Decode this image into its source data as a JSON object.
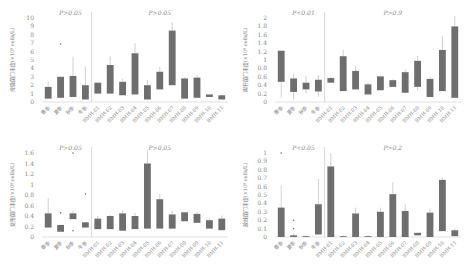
{
  "colors": {
    "bar": "#6e6e6e",
    "whisker": "#bdbdbd",
    "axis": "#cccccc",
    "divider": "#cfcfcf",
    "text": "#888888"
  },
  "chart_data": [
    {
      "type": "bar",
      "title": "",
      "ylabel": "疣微菌门丰度(×10⁸ cells/L)",
      "ylim": [
        0,
        10
      ],
      "yticks": [
        0,
        1,
        2,
        3,
        4,
        5,
        6,
        7,
        8,
        9,
        10
      ],
      "categories": [
        "春季",
        "夏季",
        "秋季",
        "冬季",
        "BMH-01",
        "BMH-02",
        "BMH-03",
        "BMH-04",
        "BMH-05",
        "BMH-06",
        "BMH-07",
        "BMH-08",
        "BMH-09",
        "BMH-10",
        "BMH-11"
      ],
      "series": [
        {
          "name": "box_low",
          "values": [
            0.4,
            0.5,
            0.6,
            0.3,
            1.0,
            1.0,
            0.8,
            0.9,
            0.3,
            1.5,
            2.0,
            0.4,
            0.5,
            0.6,
            0.3
          ]
        },
        {
          "name": "box_high",
          "values": [
            1.8,
            3.0,
            3.1,
            2.0,
            2.3,
            4.4,
            2.4,
            5.8,
            2.0,
            3.6,
            8.5,
            2.8,
            2.9,
            0.9,
            0.8
          ]
        },
        {
          "name": "whisker_high",
          "values": [
            2.4,
            3.0,
            5.4,
            4.2,
            2.3,
            5.4,
            2.8,
            7.0,
            2.6,
            4.2,
            9.5,
            3.0,
            3.2,
            0.9,
            0.9
          ]
        }
      ],
      "outliers": [
        {
          "category": "夏季",
          "value": 6.9
        }
      ],
      "annotations": [
        {
          "text": "P>0.05",
          "group": "season"
        },
        {
          "text": "P>0.05",
          "group": "site"
        }
      ],
      "divider_after": 3,
      "grid": false
    },
    {
      "type": "bar",
      "title": "",
      "ylabel": "拟杆菌门丰度(×10⁸ cells/L)",
      "ylim": [
        0,
        2
      ],
      "yticks": [
        0,
        0.2,
        0.4,
        0.6,
        0.8,
        1,
        1.2,
        1.4,
        1.6,
        1.8,
        2
      ],
      "categories": [
        "春季",
        "夏季",
        "秋季",
        "冬季",
        "BMH-01",
        "BMH-02",
        "BMH-03",
        "BMH-04",
        "BMH-05",
        "BMH-06",
        "BMH-07",
        "BMH-08",
        "BMH-09",
        "BMH-10",
        "BMH-11"
      ],
      "series": [
        {
          "name": "box_low",
          "values": [
            0.48,
            0.24,
            0.3,
            0.25,
            0.46,
            0.26,
            0.3,
            0.18,
            0.28,
            0.36,
            0.22,
            0.36,
            0.12,
            0.26,
            0.1
          ]
        },
        {
          "name": "box_high",
          "values": [
            1.22,
            0.56,
            0.46,
            0.53,
            0.57,
            1.09,
            0.74,
            0.42,
            0.61,
            0.52,
            0.71,
            0.98,
            0.55,
            1.24,
            1.8
          ]
        },
        {
          "name": "whisker_high",
          "values": [
            1.22,
            0.68,
            0.62,
            0.64,
            0.6,
            1.24,
            0.86,
            0.46,
            0.63,
            0.54,
            0.78,
            1.1,
            0.58,
            1.56,
            2.05
          ]
        },
        {
          "name": "whisker_low",
          "values": [
            0.1,
            0.06,
            0.2,
            0.12,
            0.46,
            0.26,
            0.3,
            0.18,
            0.28,
            0.36,
            0.22,
            0.28,
            0.12,
            0.26,
            0.1
          ]
        }
      ],
      "annotations": [
        {
          "text": "P<0.01",
          "group": "season"
        },
        {
          "text": "P>0.9",
          "group": "site"
        }
      ],
      "divider_after": 3,
      "grid": false
    },
    {
      "type": "bar",
      "title": "",
      "ylabel": "变形菌门丰度(×10⁸ cells/L)",
      "ylim": [
        0,
        1.6
      ],
      "yticks": [
        0,
        0.2,
        0.4,
        0.6,
        0.8,
        1,
        1.2,
        1.4,
        1.6
      ],
      "categories": [
        "春季",
        "夏季",
        "秋季",
        "冬季",
        "BMH-01",
        "BMH-02",
        "BMH-03",
        "BMH-04",
        "BMH-05",
        "BMH-06",
        "BMH-07",
        "BMH-08",
        "BMH-09",
        "BMH-10",
        "BMH-11"
      ],
      "series": [
        {
          "name": "box_low",
          "values": [
            0.18,
            0.1,
            0.34,
            0.18,
            0.15,
            0.15,
            0.12,
            0.15,
            0.16,
            0.16,
            0.16,
            0.3,
            0.27,
            0.16,
            0.13
          ]
        },
        {
          "name": "box_high",
          "values": [
            0.45,
            0.23,
            0.45,
            0.28,
            0.35,
            0.4,
            0.45,
            0.4,
            1.4,
            0.72,
            0.43,
            0.47,
            0.44,
            0.32,
            0.35
          ]
        },
        {
          "name": "whisker_high",
          "values": [
            0.74,
            0.23,
            0.5,
            0.28,
            0.4,
            0.42,
            0.52,
            0.46,
            1.65,
            0.82,
            0.5,
            0.48,
            0.48,
            0.37,
            0.41
          ]
        }
      ],
      "outliers": [
        {
          "category": "夏季",
          "value": 0.46
        },
        {
          "category": "秋季",
          "value": 1.65
        },
        {
          "category": "秋季",
          "value": 0.12
        },
        {
          "category": "冬季",
          "value": 0.82
        }
      ],
      "annotations": [
        {
          "text": "P>0.05",
          "group": "season"
        },
        {
          "text": "P>0.05",
          "group": "site"
        }
      ],
      "divider_after": 3,
      "grid": false
    },
    {
      "type": "bar",
      "title": "",
      "ylabel": "放线菌门丰度(×10⁸ cells/L)",
      "ylim": [
        0,
        1
      ],
      "yticks": [
        0,
        0.1,
        0.2,
        0.3,
        0.4,
        0.5,
        0.6,
        0.7,
        0.8,
        0.9,
        1
      ],
      "categories": [
        "春季",
        "夏季",
        "秋季",
        "冬季",
        "BMH-01",
        "BMH-02",
        "BMH-03",
        "BMH-04",
        "BMH-05",
        "BMH-06",
        "BMH-07",
        "BMH-08",
        "BMH-09",
        "BMH-10",
        "BMH-11"
      ],
      "series": [
        {
          "name": "box_low",
          "values": [
            0.0,
            0.0,
            0.0,
            0.03,
            0.0,
            0.0,
            0.0,
            0.0,
            0.0,
            0.0,
            0.0,
            0.02,
            0.0,
            0.07,
            0.01
          ]
        },
        {
          "name": "box_high",
          "values": [
            0.35,
            0.02,
            0.01,
            0.39,
            0.84,
            0.01,
            0.28,
            0.01,
            0.3,
            0.51,
            0.31,
            0.05,
            0.29,
            0.68,
            0.08
          ]
        },
        {
          "name": "whisker_high",
          "values": [
            0.61,
            0.05,
            0.02,
            0.69,
            1.0,
            0.02,
            0.35,
            0.02,
            0.35,
            0.65,
            0.39,
            0.05,
            0.34,
            0.71,
            0.1
          ]
        }
      ],
      "outliers": [
        {
          "category": "春季",
          "value": 1.0
        },
        {
          "category": "夏季",
          "value": 0.2
        },
        {
          "category": "夏季",
          "value": 0.1
        }
      ],
      "annotations": [
        {
          "text": "P<0.05",
          "group": "season"
        },
        {
          "text": "P>0.2",
          "group": "site"
        }
      ],
      "divider_after": 3,
      "grid": false
    }
  ]
}
